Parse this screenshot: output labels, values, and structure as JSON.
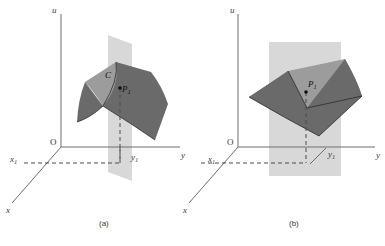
{
  "figure": {
    "type": "math-diagram",
    "background_color": "#ffffff"
  },
  "panels": [
    {
      "id": "a",
      "caption": "(a)",
      "axes": {
        "vertical_label": "u",
        "horizontal_label": "y",
        "depth_label": "x",
        "origin_label": "O"
      },
      "marks": [
        {
          "name": "x1",
          "base": "x",
          "sub": "1"
        },
        {
          "name": "y1",
          "base": "y",
          "sub": "1"
        }
      ],
      "points": [
        {
          "label_base": "P",
          "label_sub": "1"
        },
        {
          "label_base": "C",
          "label_sub": ""
        }
      ],
      "colors": {
        "surface_dark": "#6b6b6b",
        "surface_light": "#9a9a9a",
        "plane": "#d5d5d5",
        "axis": "#6e6e6e",
        "dashed": "#4a4a4a"
      }
    },
    {
      "id": "b",
      "caption": "(b)",
      "axes": {
        "vertical_label": "u",
        "horizontal_label": "y",
        "depth_label": "x",
        "origin_label": "O"
      },
      "marks": [
        {
          "name": "x1",
          "base": "x",
          "sub": "1"
        },
        {
          "name": "y1",
          "base": "y",
          "sub": "1"
        }
      ],
      "points": [
        {
          "label_base": "P",
          "label_sub": "1"
        }
      ],
      "colors": {
        "surface_dark": "#6b6b6b",
        "surface_light": "#9a9a9a",
        "plane": "#d5d5d5",
        "axis": "#6e6e6e",
        "dashed": "#4a4a4a"
      }
    }
  ]
}
